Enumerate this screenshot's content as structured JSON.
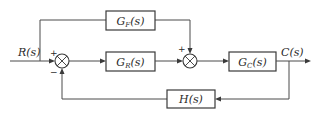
{
  "diagram": {
    "type": "control-system block diagram",
    "input": {
      "label": "R(s)"
    },
    "output": {
      "label": "C(s)"
    },
    "blocks": [
      {
        "id": "gf",
        "main": "G",
        "sub": "F",
        "arg": "(s)",
        "role": "feedforward"
      },
      {
        "id": "gr",
        "main": "G",
        "sub": "R",
        "arg": "(s)",
        "role": "controller"
      },
      {
        "id": "gc",
        "main": "G",
        "sub": "C",
        "arg": "(s)",
        "role": "plant"
      },
      {
        "id": "h",
        "main": "H",
        "sub": "",
        "arg": "(s)",
        "role": "feedback"
      }
    ],
    "summing_junctions": [
      {
        "id": "sum1",
        "signs": {
          "left": "+",
          "bottom": "−"
        }
      },
      {
        "id": "sum2",
        "signs": {
          "top": "+",
          "left": ""
        }
      }
    ],
    "connections": [
      "R(s) -> sum1 (+)",
      "R(s) -> G_F(s) -> sum2 (+)",
      "sum1 -> G_R(s) -> sum2",
      "sum2 -> G_C(s) -> C(s)",
      "C(s) -> H(s) -> sum1 (−)"
    ]
  }
}
